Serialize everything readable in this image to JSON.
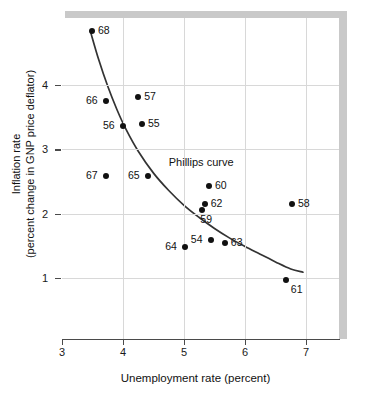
{
  "chart_data": {
    "type": "scatter",
    "title": "",
    "xlabel": "Unemployment rate (percent)",
    "ylabel_line1": "Inflation rate",
    "ylabel_line2": "(percent change in GNP  price  deflator)",
    "xlim": [
      3,
      7.55
    ],
    "ylim": [
      0.1,
      5.1
    ],
    "xticks": [
      3,
      4,
      5,
      6,
      7
    ],
    "xticklabels": [
      "3",
      "4",
      "5",
      "6",
      "7"
    ],
    "yticks": [
      1,
      2,
      3,
      4
    ],
    "yticklabels": [
      "1",
      "2",
      "3",
      "4"
    ],
    "grid": true,
    "legend": "none",
    "annotations": [
      {
        "text": "Phillips curve",
        "x": 4.75,
        "y": 2.78
      }
    ],
    "series": [
      {
        "name": "US annual observations 1954-1968",
        "marker": "filled-circle",
        "color": "#111111",
        "points": [
          {
            "label": "68",
            "x": 3.49,
            "y": 4.84,
            "label_pos": "right"
          },
          {
            "label": "66",
            "x": 3.72,
            "y": 3.75,
            "label_pos": "left"
          },
          {
            "label": "57",
            "x": 4.25,
            "y": 3.82,
            "label_pos": "right"
          },
          {
            "label": "56",
            "x": 4.0,
            "y": 3.36,
            "label_pos": "left"
          },
          {
            "label": "55",
            "x": 4.31,
            "y": 3.39,
            "label_pos": "right"
          },
          {
            "label": "67",
            "x": 3.72,
            "y": 2.59,
            "label_pos": "left"
          },
          {
            "label": "65",
            "x": 4.41,
            "y": 2.59,
            "label_pos": "left"
          },
          {
            "label": "60",
            "x": 5.41,
            "y": 2.43,
            "label_pos": "right"
          },
          {
            "label": "62",
            "x": 5.34,
            "y": 2.15,
            "label_pos": "right"
          },
          {
            "label": "59",
            "x": 5.3,
            "y": 2.06,
            "label_pos": "below"
          },
          {
            "label": "58",
            "x": 6.77,
            "y": 2.15,
            "label_pos": "right"
          },
          {
            "label": "54",
            "x": 5.44,
            "y": 1.59,
            "label_pos": "left"
          },
          {
            "label": "63",
            "x": 5.67,
            "y": 1.54,
            "label_pos": "right"
          },
          {
            "label": "64",
            "x": 5.02,
            "y": 1.48,
            "label_pos": "left"
          },
          {
            "label": "61",
            "x": 6.67,
            "y": 0.97,
            "label_pos": "below-right"
          }
        ]
      }
    ],
    "fitted_curve": {
      "name": "Phillips curve",
      "color": "#333333",
      "points": [
        {
          "x": 3.47,
          "y": 4.82
        },
        {
          "x": 3.6,
          "y": 4.4
        },
        {
          "x": 3.75,
          "y": 3.98
        },
        {
          "x": 3.9,
          "y": 3.62
        },
        {
          "x": 4.05,
          "y": 3.31
        },
        {
          "x": 4.25,
          "y": 2.97
        },
        {
          "x": 4.5,
          "y": 2.63
        },
        {
          "x": 4.75,
          "y": 2.36
        },
        {
          "x": 5.0,
          "y": 2.13
        },
        {
          "x": 5.25,
          "y": 1.94
        },
        {
          "x": 5.5,
          "y": 1.77
        },
        {
          "x": 5.75,
          "y": 1.62
        },
        {
          "x": 6.0,
          "y": 1.49
        },
        {
          "x": 6.25,
          "y": 1.37
        },
        {
          "x": 6.5,
          "y": 1.25
        },
        {
          "x": 6.75,
          "y": 1.14
        },
        {
          "x": 6.95,
          "y": 1.09
        }
      ]
    }
  },
  "colors": {
    "marker": "#111111",
    "curve": "#333333",
    "grid": "#d8d8d8",
    "axis": "#4a4a4a",
    "shadow": "#c9c9c9",
    "background": "#ffffff"
  }
}
